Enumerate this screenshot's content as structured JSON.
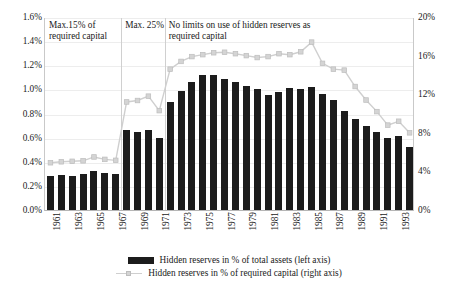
{
  "chart_data": {
    "type": "bar",
    "title": "",
    "xlabel": "",
    "ylabel_left": "",
    "ylabel_right": "",
    "grid": true,
    "legend_position": "bottom",
    "categories": [
      1961,
      1962,
      1963,
      1964,
      1965,
      1966,
      1967,
      1968,
      1969,
      1970,
      1971,
      1972,
      1973,
      1974,
      1975,
      1976,
      1977,
      1978,
      1979,
      1980,
      1981,
      1982,
      1983,
      1984,
      1985,
      1986,
      1987,
      1988,
      1989,
      1990,
      1991,
      1992,
      1993,
      1994
    ],
    "x_tick_labels": [
      "1961",
      "",
      "1963",
      "",
      "1965",
      "",
      "1967",
      "",
      "1969",
      "",
      "1971",
      "",
      "1973",
      "",
      "1975",
      "",
      "1977",
      "",
      "1979",
      "",
      "1981",
      "",
      "1983",
      "",
      "1985",
      "",
      "1987",
      "",
      "1989",
      "",
      "1991",
      "",
      "1993",
      ""
    ],
    "left_axis": {
      "ticks": [
        "0.0%",
        "0.2%",
        "0.4%",
        "0.6%",
        "0.8%",
        "1.0%",
        "1.2%",
        "1.4%",
        "1.6%"
      ],
      "tick_values": [
        0.0,
        0.2,
        0.4,
        0.6,
        0.8,
        1.0,
        1.2,
        1.4,
        1.6
      ],
      "min": 0.0,
      "max": 1.6
    },
    "right_axis": {
      "ticks": [
        "0%",
        "4%",
        "8%",
        "12%",
        "16%",
        "20%"
      ],
      "tick_values": [
        0,
        4,
        8,
        12,
        16,
        20
      ],
      "min": 0,
      "max": 20
    },
    "series": [
      {
        "name": "Hidden reserves in % of total assets (left axis)",
        "type": "bar",
        "axis": "left",
        "color": "#1c1c1c",
        "values": [
          0.28,
          0.29,
          0.285,
          0.3,
          0.32,
          0.31,
          0.295,
          0.665,
          0.645,
          0.66,
          0.6,
          0.895,
          0.99,
          1.065,
          1.12,
          1.12,
          1.085,
          1.06,
          1.03,
          1.0,
          0.955,
          0.98,
          1.01,
          1.005,
          1.02,
          0.96,
          0.91,
          0.82,
          0.755,
          0.7,
          0.645,
          0.595,
          0.61,
          0.525
        ]
      },
      {
        "name": "Hidden reserves in % of required capital (right axis)",
        "type": "line",
        "axis": "right",
        "color": "#cfcfcf",
        "marker_color": "#d4d4d4",
        "values": [
          5.0,
          5.1,
          5.15,
          5.2,
          5.6,
          5.35,
          5.25,
          11.3,
          11.45,
          11.9,
          10.4,
          14.7,
          15.5,
          16.0,
          16.2,
          16.4,
          16.45,
          16.3,
          16.1,
          15.9,
          16.0,
          16.3,
          16.2,
          16.5,
          17.5,
          15.3,
          14.7,
          14.6,
          12.9,
          11.5,
          10.3,
          8.9,
          9.3,
          8.1
        ]
      }
    ],
    "annotations": [
      {
        "id": "period-1",
        "text": "Max.15% of required capital",
        "start_year": 1961,
        "end_year": 1967
      },
      {
        "id": "period-2",
        "text": "Max. 25%",
        "start_year": 1968,
        "end_year": 1971
      },
      {
        "id": "period-3",
        "text": "No limits on use of hidden reserves as required capital",
        "start_year": 1972,
        "end_year": 1994
      }
    ],
    "dividers": [
      1967.5,
      1971.5
    ]
  },
  "legend": {
    "items": [
      {
        "label": "Hidden reserves in % of total assets (left axis)",
        "marker": "bar-swatch"
      },
      {
        "label": "Hidden reserves in % of required capital (right axis)",
        "marker": "line-swatch"
      }
    ]
  }
}
